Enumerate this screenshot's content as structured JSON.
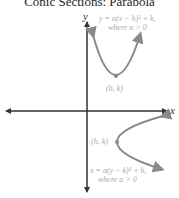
{
  "title": "Conic Sections: Parabola",
  "axes": {
    "x_label": "x",
    "y_label": "y"
  },
  "upper_parabola": {
    "equation": "y = a(x − h)² + k,",
    "condition": "where a > 0",
    "vertex_label": "(h, k)"
  },
  "right_parabola": {
    "equation": "x = a(y − k)² + h,",
    "condition": "where a > 0",
    "vertex_label": "(h, k)"
  },
  "colors": {
    "curve": "#8a8a8a",
    "axis": "#333333",
    "label": "#aaaaaa"
  }
}
